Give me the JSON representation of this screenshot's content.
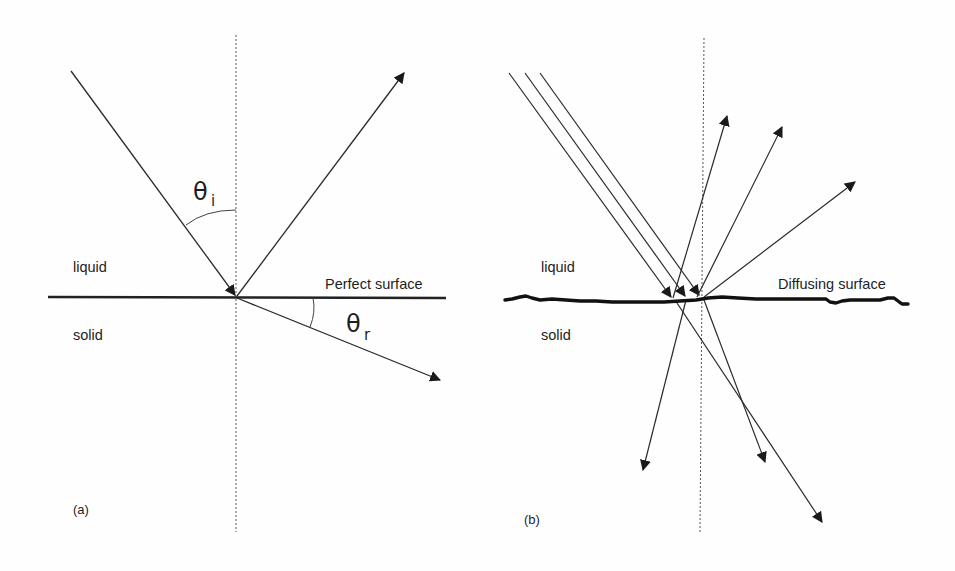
{
  "panels": [
    {
      "id": "a",
      "caption": "(a)",
      "upper_medium": "liquid",
      "lower_medium": "solid",
      "surface_label": "Perfect surface",
      "surface_type": "smooth",
      "incident_angle": {
        "symbol": "θ",
        "subscript": "i"
      },
      "refraction_angle": {
        "symbol": "θ",
        "subscript": "r"
      },
      "rays": [
        "incident",
        "reflected",
        "refracted"
      ]
    },
    {
      "id": "b",
      "caption": "(b)",
      "upper_medium": "liquid",
      "lower_medium": "solid",
      "surface_label": "Diffusing surface",
      "surface_type": "rough",
      "incident_ray_count": 3,
      "reflected_ray_count": 3,
      "transmitted_ray_count": 3
    }
  ],
  "colors": {
    "line": "#2a2a2a",
    "background": "#fefefe",
    "normal_dashed": "#555555"
  }
}
